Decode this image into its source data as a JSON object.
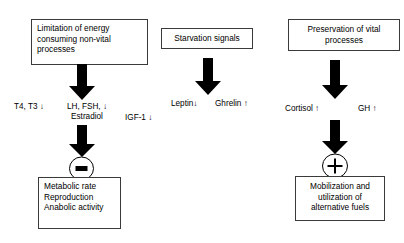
{
  "diagram": {
    "colors": {
      "stroke": "#3a3a3a",
      "arrow_fill": "#000000",
      "background": "#ffffff",
      "text": "#000000"
    },
    "columns": {
      "left": {
        "top_box": "Limitation of energy\nconsuming non-vital\nprocesses",
        "top_box_lines": [
          "Limitation of energy",
          "consuming non-vital",
          "processes"
        ],
        "mediators": [
          {
            "name": "thyroid-hormones",
            "text": "T4, T3 ↓"
          },
          {
            "name": "gonadotropins",
            "line1": "LH, FSH, ↓",
            "line2": "Estradiol"
          }
        ],
        "sign": "−",
        "sign_name": "minus",
        "bottom_box_lines": [
          "Metabolic rate",
          "Reproduction",
          "Anabolic activity"
        ]
      },
      "middle": {
        "top_box": "Starvation signals",
        "mediators": [
          {
            "name": "leptin",
            "text": "Leptin↓"
          },
          {
            "name": "ghrelin",
            "text": "Ghrelin ↑"
          }
        ]
      },
      "right": {
        "top_box_lines": [
          "Preservation of vital",
          "processes"
        ],
        "mediators": [
          {
            "name": "cortisol",
            "text": "Cortisol ↑"
          },
          {
            "name": "growth-hormone",
            "text": "GH ↑"
          }
        ],
        "sign": "+",
        "sign_name": "plus",
        "bottom_box_lines": [
          "Mobilization and",
          "utilization of",
          "alternative fuels"
        ]
      }
    },
    "standalone": {
      "igf1": "IGF-1 ↓"
    }
  }
}
